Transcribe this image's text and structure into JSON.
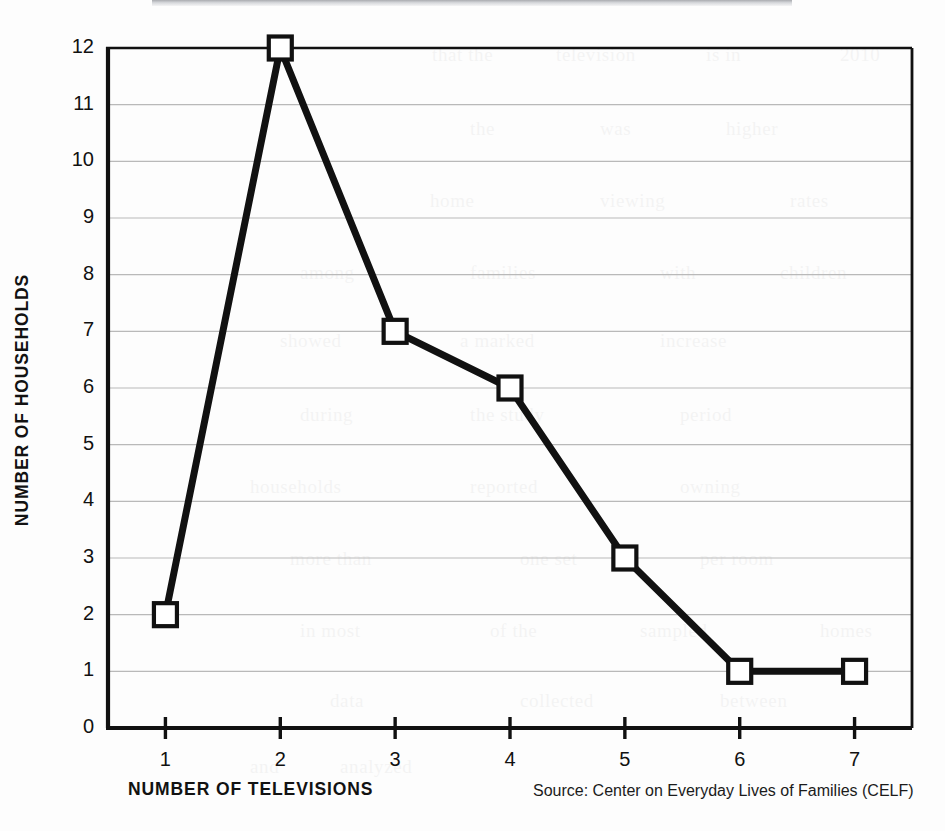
{
  "figure": {
    "background_color": "#fdfdfd",
    "ink_color": "#111111",
    "gridline_color": "#b9b9b9"
  },
  "axes": {
    "y_title": "NUMBER OF HOUSEHOLDS",
    "x_title": "NUMBER OF TELEVISIONS"
  },
  "source": {
    "note": "Source: Center on Everyday Lives of Families (CELF)"
  },
  "chart_data": {
    "type": "line",
    "title": "",
    "subtitle": "",
    "xlabel": "NUMBER OF TELEVISIONS",
    "ylabel": "NUMBER OF HOUSEHOLDS",
    "x": [
      1,
      2,
      3,
      4,
      5,
      6,
      7
    ],
    "values": [
      2,
      12,
      7,
      6,
      3,
      1,
      1
    ],
    "categories": [
      "1",
      "2",
      "3",
      "4",
      "5",
      "6",
      "7"
    ],
    "xlim": [
      0.5,
      7.5
    ],
    "ylim": [
      0,
      12
    ],
    "xticks": [
      1,
      2,
      3,
      4,
      5,
      6,
      7
    ],
    "xtick_labels": [
      "1",
      "2",
      "3",
      "4",
      "5",
      "6",
      "7"
    ],
    "yticks": [
      0,
      1,
      2,
      3,
      4,
      5,
      6,
      7,
      8,
      9,
      10,
      11,
      12
    ],
    "ytick_labels": [
      "0",
      "1",
      "2",
      "3",
      "4",
      "5",
      "6",
      "7",
      "8",
      "9",
      "10",
      "11",
      "12"
    ],
    "grid": true,
    "grid_axis": "y",
    "legend": false,
    "legend_position": "none",
    "marker": "square-open",
    "line_color": "#111111",
    "marker_face_color": "#ffffff",
    "marker_edge_color": "#111111",
    "annotations": [
      "Source: Center on Everyday Lives of Families (CELF)"
    ]
  },
  "ghost_text": [
    {
      "text": "that the",
      "x": 432,
      "y": 44
    },
    {
      "text": "television",
      "x": 556,
      "y": 44
    },
    {
      "text": "is in",
      "x": 706,
      "y": 44
    },
    {
      "text": "2010",
      "x": 840,
      "y": 44
    },
    {
      "text": "the",
      "x": 470,
      "y": 118
    },
    {
      "text": "was",
      "x": 600,
      "y": 118
    },
    {
      "text": "higher",
      "x": 726,
      "y": 118
    },
    {
      "text": "home",
      "x": 430,
      "y": 190
    },
    {
      "text": "viewing",
      "x": 600,
      "y": 190
    },
    {
      "text": "rates",
      "x": 790,
      "y": 190
    },
    {
      "text": "among",
      "x": 300,
      "y": 262
    },
    {
      "text": "families",
      "x": 470,
      "y": 262
    },
    {
      "text": "with",
      "x": 660,
      "y": 262
    },
    {
      "text": "children",
      "x": 780,
      "y": 262
    },
    {
      "text": "showed",
      "x": 280,
      "y": 330
    },
    {
      "text": "a marked",
      "x": 460,
      "y": 330
    },
    {
      "text": "increase",
      "x": 660,
      "y": 330
    },
    {
      "text": "during",
      "x": 300,
      "y": 404
    },
    {
      "text": "the study",
      "x": 470,
      "y": 404
    },
    {
      "text": "period",
      "x": 680,
      "y": 404
    },
    {
      "text": "households",
      "x": 250,
      "y": 476
    },
    {
      "text": "reported",
      "x": 470,
      "y": 476
    },
    {
      "text": "owning",
      "x": 680,
      "y": 476
    },
    {
      "text": "more than",
      "x": 290,
      "y": 548
    },
    {
      "text": "one set",
      "x": 520,
      "y": 548
    },
    {
      "text": "per room",
      "x": 700,
      "y": 548
    },
    {
      "text": "in most",
      "x": 300,
      "y": 620
    },
    {
      "text": "of the",
      "x": 490,
      "y": 620
    },
    {
      "text": "sampled",
      "x": 640,
      "y": 620
    },
    {
      "text": "homes",
      "x": 820,
      "y": 620
    },
    {
      "text": "data",
      "x": 330,
      "y": 690
    },
    {
      "text": "collected",
      "x": 520,
      "y": 690
    },
    {
      "text": "between",
      "x": 720,
      "y": 690
    },
    {
      "text": "and",
      "x": 250,
      "y": 756
    },
    {
      "text": "analyzed",
      "x": 340,
      "y": 756
    }
  ]
}
